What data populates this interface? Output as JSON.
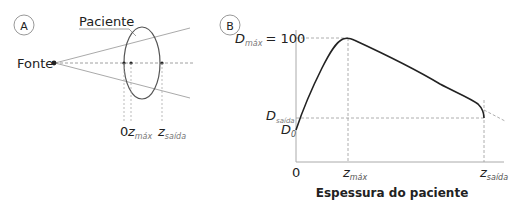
{
  "panel_a": {
    "badge": "A",
    "patient_label": "Paciente",
    "source_label": "Fonte",
    "marks": {
      "zero": "0",
      "z": "z",
      "zmax_sub": "máx",
      "zsaida_sub": "saída"
    }
  },
  "panel_b": {
    "badge": "B",
    "dmax_label": "D",
    "dmax_sub": "máx",
    "dmax_value": "= 100",
    "dsaida_label": "D",
    "dsaida_sub": "saída",
    "d0_label": "D",
    "d0_sub": "0",
    "x_zero": "0",
    "zmax_label": "z",
    "zmax_sub": "máx",
    "zsaida_label": "z",
    "zsaida_sub": "saída",
    "xlabel": "Espessura do paciente"
  },
  "colors": {
    "curve": "#222222",
    "axis": "#aaaaaa",
    "dashed": "#999999",
    "text": "#222222"
  }
}
